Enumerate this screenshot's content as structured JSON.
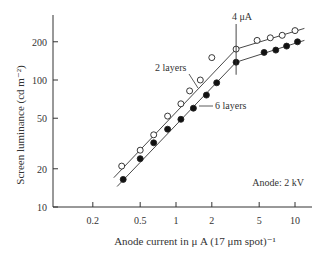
{
  "chart_data": {
    "type": "line",
    "title": "",
    "xlabel": "Anode current in μ A (17 μm spot)⁻¹",
    "ylabel": "Screen luminance (cd m⁻²)",
    "xscale": "log",
    "yscale": "log",
    "xlim": [
      0.12,
      13
    ],
    "ylim": [
      10,
      300
    ],
    "x_ticks": [
      0.2,
      0.5,
      1,
      2,
      5,
      10
    ],
    "x_tick_labels": [
      "0.2",
      "0.5",
      "1",
      "2",
      "5",
      "10"
    ],
    "y_ticks": [
      10,
      20,
      50,
      100,
      200
    ],
    "y_tick_labels": [
      "10",
      "20",
      "50",
      "100",
      "200"
    ],
    "grid": false,
    "annotations": [
      {
        "text": "4 μA",
        "x": 3.2,
        "note": "vertical marker at knee"
      },
      {
        "text": "2 layers",
        "points_to": "open-circle series"
      },
      {
        "text": "6 layers",
        "points_to": "filled-circle series"
      },
      {
        "text": "Anode: 2 kV",
        "position": "lower right"
      }
    ],
    "series": [
      {
        "name": "2 layers",
        "marker": "open circle",
        "x": [
          0.35,
          0.5,
          0.65,
          0.85,
          1.1,
          1.3,
          1.6,
          2.0,
          3.2,
          4.8,
          6.2,
          7.8,
          10.0
        ],
        "y": [
          21,
          28,
          37,
          52,
          65,
          82,
          100,
          150,
          175,
          205,
          215,
          225,
          245
        ]
      },
      {
        "name": "6 layers",
        "marker": "filled circle",
        "x": [
          0.36,
          0.5,
          0.65,
          0.85,
          1.1,
          1.4,
          1.8,
          2.2,
          3.2,
          5.5,
          6.9,
          8.5,
          10.5
        ],
        "y": [
          16.5,
          24,
          32,
          41,
          49,
          60,
          76,
          95,
          138,
          165,
          172,
          185,
          200
        ]
      }
    ]
  },
  "labels": {
    "ylabel": "Screen luminance (cd m⁻²)",
    "xlabel": "Anode current in μ A (17 μm spot)⁻¹",
    "marker_4ua": "4 μA",
    "two_layers": "2 layers",
    "six_layers": "6 layers",
    "anode": "Anode: 2 kV"
  }
}
